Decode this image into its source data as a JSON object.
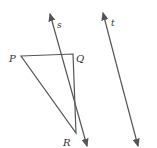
{
  "diagram": {
    "title": "",
    "points": {
      "P": {
        "label": "P",
        "x": 21,
        "y": 56
      },
      "Q": {
        "label": "Q",
        "x": 73,
        "y": 54
      },
      "R": {
        "label": "R",
        "x": 76,
        "y": 133
      }
    },
    "lines": {
      "s": {
        "label": "s",
        "x1": 50,
        "y1": 14,
        "x2": 87,
        "y2": 146
      },
      "t": {
        "label": "t",
        "x1": 103,
        "y1": 13,
        "x2": 138,
        "y2": 146
      }
    },
    "colors": {
      "stroke": "#555555",
      "text": "#333333"
    }
  }
}
